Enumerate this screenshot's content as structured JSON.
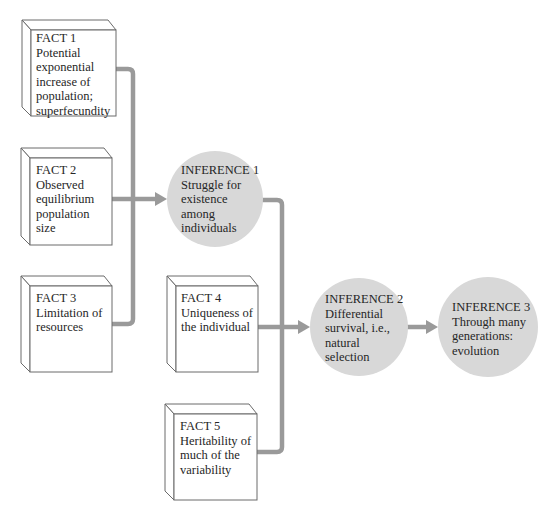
{
  "diagram": {
    "facts": [
      {
        "id": "fact-1",
        "lines": [
          "FACT 1",
          "Potential",
          "exponential",
          "increase of",
          "population;",
          "superfecundity"
        ]
      },
      {
        "id": "fact-2",
        "lines": [
          "FACT 2",
          "Observed",
          "equilibrium",
          "population",
          "size"
        ]
      },
      {
        "id": "fact-3",
        "lines": [
          "FACT 3",
          "Limitation of",
          "resources"
        ]
      },
      {
        "id": "fact-4",
        "lines": [
          "FACT 4",
          "Uniqueness of",
          "the individual"
        ]
      },
      {
        "id": "fact-5",
        "lines": [
          "FACT 5",
          "Heritability of",
          "much of the",
          "variability"
        ]
      }
    ],
    "inferences": [
      {
        "id": "inference-1",
        "lines": [
          "INFERENCE 1",
          "Struggle for",
          "existence",
          "among",
          "individuals"
        ]
      },
      {
        "id": "inference-2",
        "lines": [
          "INFERENCE 2",
          "Differential",
          "survival, i.e.,",
          "natural",
          "selection"
        ]
      },
      {
        "id": "inference-3",
        "lines": [
          "INFERENCE 3",
          "Through many",
          "generations:",
          "evolution"
        ]
      }
    ],
    "edges": [
      {
        "from": "fact-1",
        "to": "inference-1"
      },
      {
        "from": "fact-2",
        "to": "inference-1"
      },
      {
        "from": "fact-3",
        "to": "inference-1"
      },
      {
        "from": "inference-1",
        "to": "inference-2"
      },
      {
        "from": "fact-4",
        "to": "inference-2"
      },
      {
        "from": "fact-5",
        "to": "inference-2"
      },
      {
        "from": "inference-2",
        "to": "inference-3"
      }
    ],
    "colors": {
      "connector": "#9a9a9a",
      "inference_fill": "#d8d8d8",
      "box_stroke": "#6a6a6a",
      "text": "#262626"
    }
  }
}
